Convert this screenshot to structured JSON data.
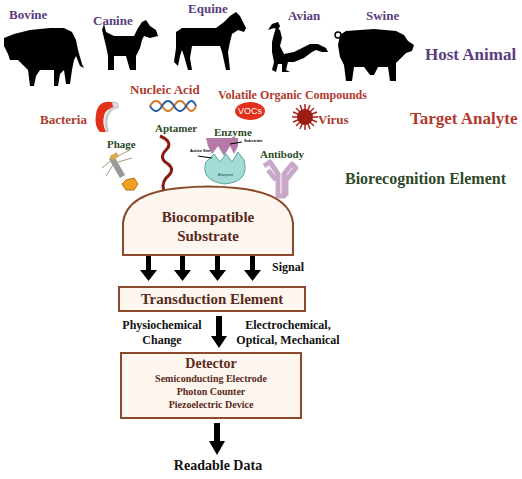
{
  "host_animal": {
    "row_label": "Host Animal",
    "animals": [
      {
        "name": "Bovine",
        "icon": "cow-silhouette"
      },
      {
        "name": "Canine",
        "icon": "dog-silhouette"
      },
      {
        "name": "Equine",
        "icon": "horse-silhouette"
      },
      {
        "name": "Avian",
        "icon": "rooster-silhouette"
      },
      {
        "name": "Swine",
        "icon": "pig-silhouette"
      }
    ]
  },
  "target_analyte": {
    "row_label": "Target Analyte",
    "items": {
      "bacteria": "Bacteria",
      "nucleic_acid": "Nucleic Acid",
      "vocs_full": "Volatile Organic Compounds",
      "vocs_badge": "VOCs",
      "virus": "Virus"
    }
  },
  "biorecognition": {
    "row_label": "Biorecognition Element",
    "items": {
      "phage": "Phage",
      "aptamer": "Aptamer",
      "enzyme": "Enzyme",
      "enzyme_substrate": "Substrate",
      "enzyme_active_site": "Active Site",
      "enzyme_body": "Enzyme",
      "antibody": "Antibody"
    }
  },
  "substrate": {
    "line1": "Biocompatible",
    "line2": "Substrate"
  },
  "signal_label": "Signal",
  "transduction": {
    "title": "Transduction Element",
    "left_line1": "Physiochemical",
    "left_line2": "Change",
    "right_line1": "Electrochemical,",
    "right_line2": "Optical, Mechanical"
  },
  "detector": {
    "title": "Detector",
    "items": [
      "Semiconducting Electrode",
      "Photon Counter",
      "Piezoelectric Device"
    ]
  },
  "output": "Readable Data",
  "colors": {
    "host_animal": "#5a3d7e",
    "target_analyte": "#b03a2e",
    "biorecognition": "#2f4a2a",
    "box_border": "#8b4a2b",
    "box_fill": "#fdf6ee",
    "box_text": "#5a2a20"
  }
}
